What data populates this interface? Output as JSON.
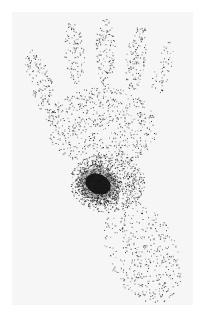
{
  "image": {
    "kind": "scintigraphy-hand-scan",
    "width": 203,
    "height": 316,
    "background": "#ffffff",
    "frame": {
      "x": 12,
      "y": 12,
      "w": 181,
      "h": 293,
      "fill": "#f6f6f6"
    },
    "dot_color": "#1a1a1a",
    "hotspot_color": "#0a0a0a"
  },
  "regions": [
    {
      "name": "thumb",
      "cx": 30,
      "cy": 75,
      "rx": 12,
      "ry": 40,
      "rot": -20,
      "density": 0.1
    },
    {
      "name": "index-finger",
      "cx": 62,
      "cy": 40,
      "rx": 10,
      "ry": 32,
      "rot": -5,
      "density": 0.1
    },
    {
      "name": "middle-finger",
      "cx": 93,
      "cy": 40,
      "rx": 10,
      "ry": 34,
      "rot": 0,
      "density": 0.12
    },
    {
      "name": "ring-finger",
      "cx": 124,
      "cy": 45,
      "rx": 10,
      "ry": 34,
      "rot": 8,
      "density": 0.12
    },
    {
      "name": "little-finger",
      "cx": 150,
      "cy": 58,
      "rx": 8,
      "ry": 30,
      "rot": 15,
      "density": 0.07
    },
    {
      "name": "palm",
      "cx": 90,
      "cy": 115,
      "rx": 55,
      "ry": 40,
      "rot": 0,
      "density": 0.09
    },
    {
      "name": "wrist",
      "cx": 95,
      "cy": 170,
      "rx": 38,
      "ry": 30,
      "rot": 0,
      "density": 0.22
    },
    {
      "name": "forearm",
      "cx": 130,
      "cy": 240,
      "rx": 35,
      "ry": 55,
      "rot": -25,
      "density": 0.07
    }
  ],
  "hotspot": {
    "name": "carpal-hotspot",
    "cx": 86,
    "cy": 172,
    "rx": 13,
    "ry": 10,
    "rot": 25
  }
}
